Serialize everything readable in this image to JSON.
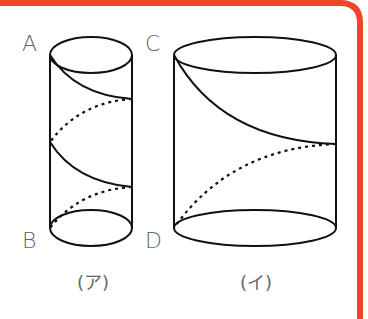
{
  "frame": {
    "border_color": "#f0442c"
  },
  "figure_a": {
    "caption": "(ア)",
    "top_label": "A",
    "bottom_label": "B"
  },
  "figure_b": {
    "caption": "(イ)",
    "top_label": "C",
    "bottom_label": "D"
  }
}
